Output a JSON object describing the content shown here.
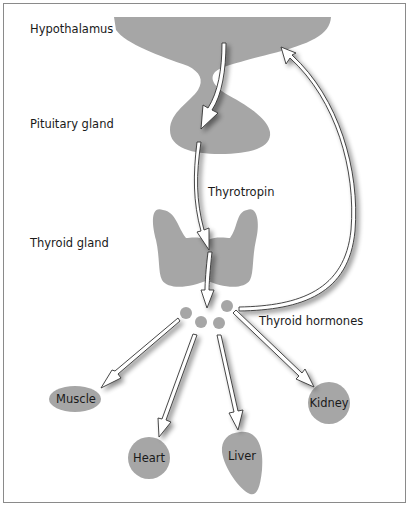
{
  "diagram": {
    "type": "flowchart",
    "colors": {
      "organ_fill": "#a6a6a6",
      "arrow_fill": "#ffffff",
      "arrow_stroke": "#333333",
      "border": "#8a8a8a"
    },
    "labels": {
      "hypothalamus": "Hypothalamus",
      "pituitary": "Pituitary gland",
      "thyrotropin": "Thyrotropin",
      "thyroid": "Thyroid gland",
      "hormones": "Thyroid hormones"
    },
    "targets": [
      {
        "id": "muscle",
        "label": "Muscle"
      },
      {
        "id": "heart",
        "label": "Heart"
      },
      {
        "id": "liver",
        "label": "Liver"
      },
      {
        "id": "kidney",
        "label": "Kidney"
      }
    ],
    "edges": [
      {
        "from": "Hypothalamus",
        "to": "Pituitary gland"
      },
      {
        "from": "Pituitary gland",
        "to": "Thyroid gland",
        "label": "Thyrotropin"
      },
      {
        "from": "Thyroid gland",
        "to": "Thyroid hormones"
      },
      {
        "from": "Thyroid hormones",
        "to": "Hypothalamus",
        "type": "feedback"
      },
      {
        "from": "Thyroid hormones",
        "to": "Muscle"
      },
      {
        "from": "Thyroid hormones",
        "to": "Heart"
      },
      {
        "from": "Thyroid hormones",
        "to": "Liver"
      },
      {
        "from": "Thyroid hormones",
        "to": "Kidney"
      }
    ]
  }
}
